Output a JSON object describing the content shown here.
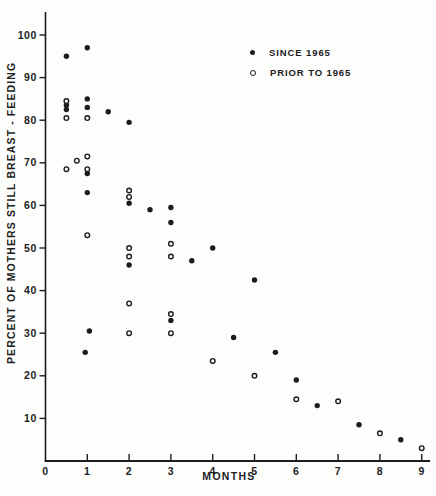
{
  "chart_data": {
    "type": "scatter",
    "title": "",
    "xlabel": "MONTHS",
    "ylabel": "PERCENT OF MOTHERS STILL BREAST - FEEDING",
    "xlim": [
      0,
      9.2
    ],
    "ylim": [
      0,
      105
    ],
    "x_ticks": [
      0,
      1,
      2,
      3,
      4,
      5,
      6,
      7,
      8,
      9
    ],
    "y_ticks": [
      10,
      20,
      30,
      40,
      50,
      60,
      70,
      80,
      90,
      100
    ],
    "grid": false,
    "legend_position": "upper-right-inside",
    "ink_color": "#1c1c1c",
    "paper_color": "#fdfdfc",
    "series": [
      {
        "name": "SINCE 1965",
        "marker": "filled",
        "points": [
          [
            0.5,
            95
          ],
          [
            0.5,
            83.5
          ],
          [
            0.5,
            82.5
          ],
          [
            1,
            97
          ],
          [
            1,
            85
          ],
          [
            1,
            83
          ],
          [
            1,
            67.5
          ],
          [
            1,
            63
          ],
          [
            1.05,
            30.5
          ],
          [
            0.95,
            25.5
          ],
          [
            1.5,
            82
          ],
          [
            2,
            79.5
          ],
          [
            2,
            60.5
          ],
          [
            2,
            46
          ],
          [
            2.5,
            59
          ],
          [
            3,
            59.5
          ],
          [
            3,
            56
          ],
          [
            3,
            33
          ],
          [
            3.5,
            47
          ],
          [
            4,
            50
          ],
          [
            4.5,
            29
          ],
          [
            5,
            42.5
          ],
          [
            5.5,
            25.5
          ],
          [
            6,
            19
          ],
          [
            6.5,
            13
          ],
          [
            7.5,
            8.5
          ],
          [
            8.5,
            5
          ]
        ]
      },
      {
        "name": "PRIOR TO 1965",
        "marker": "open",
        "points": [
          [
            0.5,
            84.5
          ],
          [
            0.5,
            80.5
          ],
          [
            0.5,
            68.5
          ],
          [
            0.75,
            70.5
          ],
          [
            1,
            80.5
          ],
          [
            1,
            71.5
          ],
          [
            1,
            68.5
          ],
          [
            1,
            53
          ],
          [
            2,
            63.5
          ],
          [
            2,
            62
          ],
          [
            2,
            50
          ],
          [
            2,
            48
          ],
          [
            2,
            37
          ],
          [
            2,
            30
          ],
          [
            3,
            51
          ],
          [
            3,
            48
          ],
          [
            3,
            34.5
          ],
          [
            3,
            30
          ],
          [
            4,
            23.5
          ],
          [
            5,
            20
          ],
          [
            6,
            14.5
          ],
          [
            7,
            14
          ],
          [
            8,
            6.5
          ],
          [
            9,
            3
          ]
        ]
      }
    ]
  }
}
